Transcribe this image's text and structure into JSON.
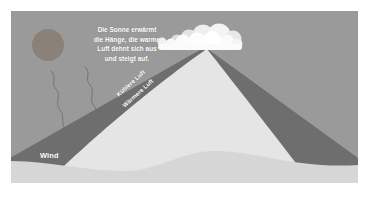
{
  "figure": {
    "title_text": {
      "lines": [
        "Die Sonne erwärmt",
        "die Hänge, die warme",
        "Luft dehnt sich aus",
        "und steigt auf."
      ]
    },
    "labels": {
      "cooler_air": "Kühlere Luft",
      "warmer_air": "Wärmere Luft",
      "wind": "Wind"
    },
    "icons": {
      "sun": "sun-icon",
      "clouds": "cloud-icon",
      "wind_streamlines": "wind-line-icon",
      "mountain": "mountain-icon"
    },
    "colors": {
      "page": "#ffffff",
      "sky": "#9a9a9a",
      "sun": "#8a8178",
      "mountain_lit": "#e5e5e5",
      "mountain_shadow": "#6e6e6e",
      "mountain_shadow_right": "#6b6b6b",
      "foreground": "#d6d6d6",
      "cloud": "#fbfbfb",
      "cloud_shadow": "#d9d9d9",
      "text": "#ffffff",
      "wind_line": "#6f6f6f"
    }
  }
}
